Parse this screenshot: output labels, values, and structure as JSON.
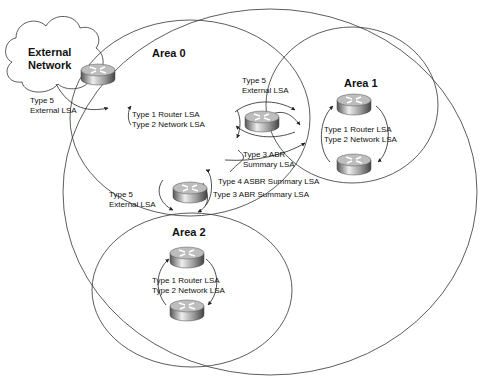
{
  "external_network": {
    "line1": "External",
    "line2": "Network"
  },
  "areas": {
    "area0": {
      "title": "Area 0",
      "lsa1": "Type 1 Router LSA",
      "lsa2": "Type 2 Network LSA"
    },
    "area1": {
      "title": "Area 1",
      "lsa1": "Type 1 Router LSA",
      "lsa2": "Type 2 Network LSA"
    },
    "area2": {
      "title": "Area 2",
      "lsa1": "Type 1 Router LSA",
      "lsa2": "Type 2 Network LSA"
    }
  },
  "labels": {
    "asbr_type5": {
      "l1": "Type 5",
      "l2": "External LSA"
    },
    "abr1_type5": {
      "l1": "Type 5",
      "l2": "External LSA"
    },
    "abr1_type3": {
      "l1": "Type 3 ABR",
      "l2": "Summary LSA"
    },
    "type4": "Type 4 ASBR Summary LSA",
    "abr2_type3": "Type 3 ABR Summary LSA",
    "abr2_type5": {
      "l1": "Type 5",
      "l2": "External LSA"
    }
  },
  "colors": {
    "line": "#333333",
    "router_light": "#e6e6e6",
    "router_dark": "#666666"
  }
}
